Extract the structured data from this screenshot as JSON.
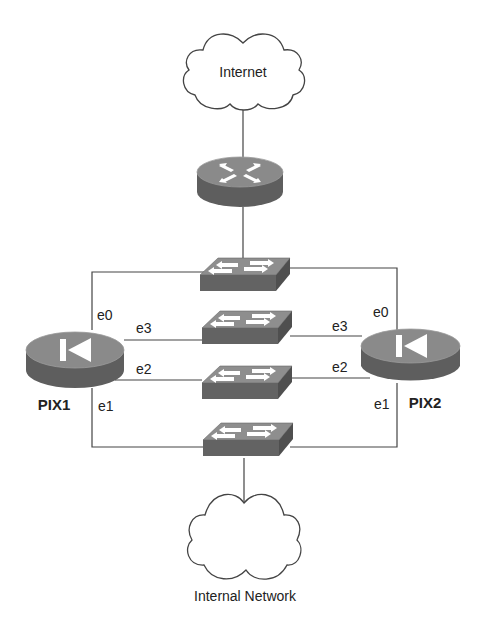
{
  "diagram": {
    "clouds": [
      {
        "id": "internet",
        "label": "Internet",
        "icon": "cloud-icon"
      },
      {
        "id": "internal",
        "label": "Internal Network",
        "icon": "cloud-icon"
      }
    ],
    "router": {
      "id": "router",
      "icon": "router-icon"
    },
    "switches": [
      {
        "id": "switch-1",
        "icon": "switch-icon"
      },
      {
        "id": "switch-2",
        "icon": "switch-icon"
      },
      {
        "id": "switch-3",
        "icon": "switch-icon"
      },
      {
        "id": "switch-4",
        "icon": "switch-icon"
      }
    ],
    "firewalls": [
      {
        "id": "pix1",
        "label": "PIX1",
        "icon": "pix-firewall-icon",
        "interfaces": {
          "e0": "e0",
          "e1": "e1",
          "e2": "e2",
          "e3": "e3"
        }
      },
      {
        "id": "pix2",
        "label": "PIX2",
        "icon": "pix-firewall-icon",
        "interfaces": {
          "e0": "e0",
          "e1": "e1",
          "e2": "e2",
          "e3": "e3"
        }
      }
    ],
    "links": [
      {
        "from": "internet",
        "to": "router"
      },
      {
        "from": "router",
        "to": "switch-1"
      },
      {
        "from": "pix1",
        "iface": "e0",
        "to": "switch-1"
      },
      {
        "from": "pix2",
        "iface": "e0",
        "to": "switch-1"
      },
      {
        "from": "pix1",
        "iface": "e3",
        "to": "switch-2"
      },
      {
        "from": "pix2",
        "iface": "e3",
        "to": "switch-2"
      },
      {
        "from": "pix1",
        "iface": "e2",
        "to": "switch-3"
      },
      {
        "from": "pix2",
        "iface": "e2",
        "to": "switch-3"
      },
      {
        "from": "pix1",
        "iface": "e1",
        "to": "switch-4"
      },
      {
        "from": "pix2",
        "iface": "e1",
        "to": "switch-4"
      },
      {
        "from": "switch-4",
        "to": "internal"
      }
    ],
    "colors": {
      "device_top": "#8a8a8a",
      "device_side": "#5e5e5e",
      "arrow": "#ffffff",
      "wire": "#444444"
    }
  }
}
